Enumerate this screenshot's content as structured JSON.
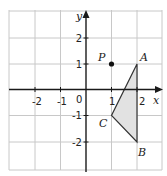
{
  "diagram": {
    "type": "coordinate-grid",
    "x_range": [
      -3,
      3
    ],
    "y_range": [
      -3,
      3
    ],
    "axes": {
      "x_label": "x",
      "y_label": "y"
    },
    "x_ticks": [
      {
        "value": -2,
        "label": "-2"
      },
      {
        "value": -1,
        "label": "-1"
      },
      {
        "value": 1,
        "label": "1"
      },
      {
        "value": 2,
        "label": "2"
      }
    ],
    "y_ticks": [
      {
        "value": 2,
        "label": "2"
      },
      {
        "value": 1,
        "label": "1"
      },
      {
        "value": -1,
        "label": "-1"
      },
      {
        "value": -2,
        "label": "-2"
      }
    ],
    "origin_label": "0",
    "point_P": {
      "label": "P",
      "x": 1,
      "y": 1
    },
    "triangle": {
      "fill": "#e2e2e2",
      "vertices": [
        {
          "label": "A",
          "x": 2,
          "y": 1
        },
        {
          "label": "B",
          "x": 2,
          "y": -2
        },
        {
          "label": "C",
          "x": 1,
          "y": -1
        }
      ]
    }
  }
}
